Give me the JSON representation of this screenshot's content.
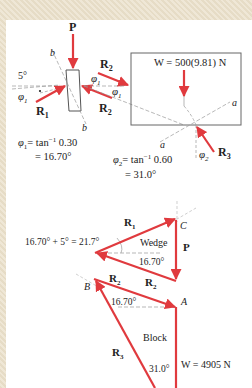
{
  "colors": {
    "force": "#e03a3e",
    "line": "#555555",
    "dash": "#9a9a9a",
    "text": "#222222"
  },
  "free_body": {
    "P": "P",
    "R1": "R",
    "R1_sub": "1",
    "R2": "R",
    "R2_sub": "2",
    "R3": "R",
    "R3_sub": "3",
    "b_label": "b",
    "a_label": "a",
    "angle_5": "5°",
    "phi1": "φ",
    "phi1_sub": "1",
    "phi2": "φ",
    "phi2_sub": "2",
    "weight_label": "W = 500(9.81) N",
    "phi1_eq_line1": "= tan",
    "phi1_eq_line1_sup": "−1",
    "phi1_eq_line1_val": " 0.30",
    "phi1_eq_line2": "= 16.70°",
    "phi2_eq_line1": "= tan",
    "phi2_eq_line1_sup": "−1",
    "phi2_eq_line1_val": " 0.60",
    "phi2_eq_line2": "= 31.0°"
  },
  "force_polygon": {
    "angle_sum": "16.70° + 5° = 21.7°",
    "wedge": "Wedge",
    "block": "Block",
    "angle_wedge": "16.70°",
    "angle_block": "16.70°",
    "angle_31": "31.0°",
    "point_A": "A",
    "point_B": "B",
    "point_C": "C",
    "weight": "W = 4905 N",
    "P": "P",
    "R": "R",
    "s1": "1",
    "s2": "2",
    "s3": "3"
  }
}
